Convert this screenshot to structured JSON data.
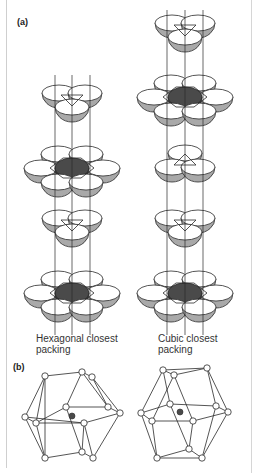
{
  "figure": {
    "part_a_label": "(a)",
    "part_b_label": "(b)",
    "captions": {
      "hexagonal": [
        "Hexagonal closest",
        "packing"
      ],
      "cubic": [
        "Cubic closest",
        "packing"
      ]
    },
    "colors": {
      "outline": "#2a2a2a",
      "shade": "#a9a9a9",
      "center_fill": "#4a4a4a",
      "sphere_top": "#ffffff",
      "frame": "#cfcfcf"
    },
    "hexagonal_stack": {
      "axis_x": [
        55,
        72,
        90
      ],
      "axis_y": [
        75,
        335
      ],
      "layers": [
        {
          "type": "three",
          "cx": 72,
          "cy": 100,
          "orientation": "down"
        },
        {
          "type": "seven",
          "cx": 72,
          "cy": 168
        },
        {
          "type": "three",
          "cx": 72,
          "cy": 225,
          "orientation": "down"
        },
        {
          "type": "seven",
          "cx": 72,
          "cy": 293
        }
      ]
    },
    "cubic_stack": {
      "axis_x": [
        167,
        185,
        203
      ],
      "axis_y": [
        10,
        335
      ],
      "layers": [
        {
          "type": "three",
          "cx": 185,
          "cy": 30,
          "orientation": "down"
        },
        {
          "type": "seven",
          "cx": 185,
          "cy": 97
        },
        {
          "type": "three",
          "cx": 185,
          "cy": 160,
          "orientation": "up"
        },
        {
          "type": "three",
          "cx": 185,
          "cy": 225,
          "orientation": "down"
        },
        {
          "type": "seven",
          "cx": 185,
          "cy": 293
        }
      ]
    },
    "polyhedra": [
      {
        "name": "hcp-coordination",
        "center": [
          72,
          416
        ],
        "nodes": [
          [
            45,
            376
          ],
          [
            82,
            372
          ],
          [
            92,
            377
          ],
          [
            25,
            417
          ],
          [
            36,
            423
          ],
          [
            66,
            407
          ],
          [
            108,
            407
          ],
          [
            120,
            413
          ],
          [
            84,
            423
          ],
          [
            45,
            458
          ],
          [
            82,
            452
          ],
          [
            93,
            458
          ]
        ],
        "edges": [
          [
            0,
            1
          ],
          [
            1,
            2
          ],
          [
            0,
            3
          ],
          [
            0,
            4
          ],
          [
            3,
            4
          ],
          [
            0,
            9
          ],
          [
            3,
            9
          ],
          [
            4,
            5
          ],
          [
            5,
            6
          ],
          [
            6,
            7
          ],
          [
            4,
            8
          ],
          [
            8,
            7
          ],
          [
            3,
            8
          ],
          [
            2,
            7
          ],
          [
            1,
            6
          ],
          [
            2,
            6
          ],
          [
            9,
            10
          ],
          [
            10,
            11
          ],
          [
            9,
            4
          ],
          [
            10,
            8
          ],
          [
            11,
            7
          ],
          [
            11,
            8
          ],
          [
            5,
            10
          ],
          [
            1,
            5
          ]
        ]
      },
      {
        "name": "ccp-coordination",
        "center": [
          180,
          412
        ],
        "nodes": [
          [
            163,
            370
          ],
          [
            174,
            375
          ],
          [
            207,
            368
          ],
          [
            141,
            413
          ],
          [
            152,
            421
          ],
          [
            170,
            404
          ],
          [
            216,
            406
          ],
          [
            228,
            412
          ],
          [
            193,
            421
          ],
          [
            157,
            458
          ],
          [
            189,
            449
          ],
          [
            202,
            458
          ]
        ],
        "edges": [
          [
            0,
            1
          ],
          [
            0,
            2
          ],
          [
            1,
            2
          ],
          [
            0,
            3
          ],
          [
            0,
            5
          ],
          [
            1,
            4
          ],
          [
            3,
            4
          ],
          [
            3,
            5
          ],
          [
            5,
            6
          ],
          [
            6,
            7
          ],
          [
            4,
            8
          ],
          [
            8,
            7
          ],
          [
            2,
            7
          ],
          [
            2,
            6
          ],
          [
            3,
            9
          ],
          [
            4,
            9
          ],
          [
            9,
            10
          ],
          [
            9,
            11
          ],
          [
            10,
            11
          ],
          [
            10,
            8
          ],
          [
            11,
            7
          ],
          [
            5,
            10
          ],
          [
            1,
            8
          ],
          [
            6,
            11
          ]
        ]
      }
    ]
  }
}
